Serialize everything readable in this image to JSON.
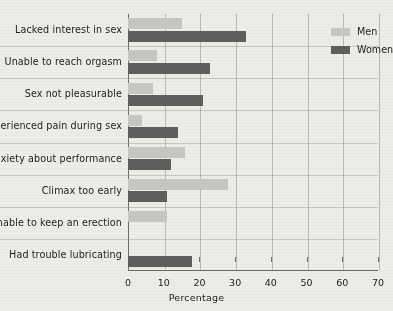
{
  "chart_data": {
    "type": "bar",
    "orientation": "horizontal",
    "title": "",
    "xlabel": "Percentage",
    "ylabel": "",
    "xlim": [
      0,
      70
    ],
    "xticks": [
      0,
      10,
      20,
      30,
      40,
      50,
      60,
      70
    ],
    "grid": true,
    "legend_position": "top-right",
    "categories": [
      "Lacked interest in sex",
      "Unable to reach orgasm",
      "Sex not pleasurable",
      "Experienced pain during sex",
      "Anxiety about performance",
      "Climax too early",
      "Unable to keep an erection",
      "Had trouble lubricating"
    ],
    "series": [
      {
        "name": "Men",
        "color": "#c7c7c2",
        "values": [
          15,
          8,
          7,
          4,
          16,
          28,
          11,
          null
        ]
      },
      {
        "name": "Women",
        "color": "#5e5e5c",
        "values": [
          33,
          23,
          21,
          14,
          12,
          11,
          null,
          18
        ]
      }
    ]
  },
  "legend": {
    "items": [
      {
        "label": "Men"
      },
      {
        "label": "Women"
      }
    ]
  }
}
